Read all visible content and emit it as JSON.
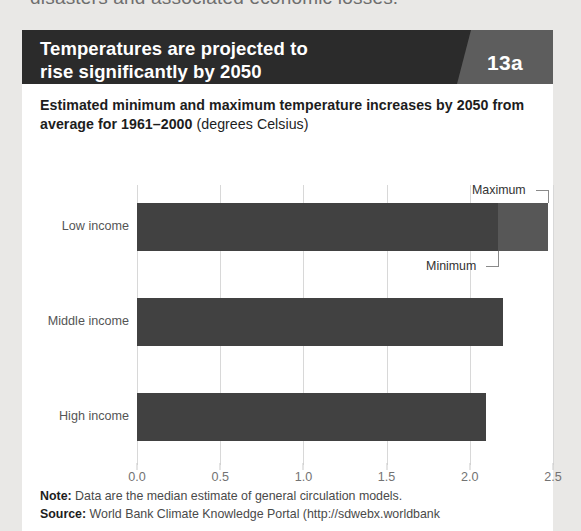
{
  "page": {
    "clipped_body_text": "disasters and associated economic losses."
  },
  "card": {
    "header": {
      "title_line1": "Temperatures are projected to",
      "title_line2": "rise significantly by 2050",
      "badge": "13a",
      "bg_color": "#2b2b2b",
      "badge_bg_color": "#5d5d5d"
    },
    "subtitle_bold": "Estimated minimum and maximum temperature increases by 2050 from average for 1961–2000",
    "subtitle_normal": " (degrees Celsius)",
    "footer": {
      "note_label": "Note:",
      "note_text": " Data are the median estimate of general circulation models.",
      "source_label": "Source:",
      "source_text": " World Bank Climate Knowledge Portal (http://sdwebx.worldbank"
    }
  },
  "chart_data": {
    "type": "bar",
    "orientation": "horizontal",
    "title": "Temperatures are projected to rise significantly by 2050",
    "subtitle": "Estimated minimum and maximum temperature increases by 2050 from average for 1961–2000 (degrees Celsius)",
    "xlabel": "",
    "ylabel": "",
    "xlim": [
      0.0,
      2.5
    ],
    "grid": true,
    "legend_position": "inline-annotations",
    "categories": [
      "Low income",
      "Middle income",
      "High income"
    ],
    "tick_labels": [
      "0.0",
      "0.5",
      "1.0",
      "1.5",
      "2.0",
      "2.5"
    ],
    "tick_values": [
      0.0,
      0.5,
      1.0,
      1.5,
      2.0,
      2.5
    ],
    "series": [
      {
        "name": "Minimum",
        "color": "#414141",
        "values": [
          2.17,
          2.2,
          2.1
        ]
      },
      {
        "name": "Maximum",
        "color": "#575757",
        "values": [
          2.47,
          2.2,
          2.1
        ]
      }
    ],
    "annotations": [
      {
        "label": "Maximum",
        "target_category": "Low income",
        "target_value": 2.47
      },
      {
        "label": "Minimum",
        "target_category": "Low income",
        "target_value": 2.17
      }
    ]
  }
}
